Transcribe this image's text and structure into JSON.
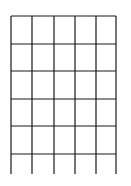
{
  "diagram": {
    "type": "grid",
    "line_color": "#1a1a1a",
    "line_width": 1.2,
    "columns": 5,
    "rows": 6,
    "open_bottom": true,
    "vertical_lines_x": [
      11,
      32,
      54,
      75,
      96,
      116
    ],
    "horizontal_lines_y": [
      16,
      44,
      71,
      99,
      126,
      154
    ],
    "vertical_extent": {
      "top": 16,
      "bottom": 174
    }
  }
}
